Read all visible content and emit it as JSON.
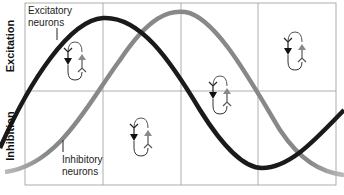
{
  "axes": {
    "top_label": "Excitation",
    "bottom_label": "Inhibition"
  },
  "labels": {
    "excitatory": [
      "Excitatory",
      "neurons"
    ],
    "inhibitory": [
      "Inhibitory",
      "neurons"
    ]
  },
  "colors": {
    "excitatory_curve": "#1a1a1a",
    "inhibitory_curve": "#8a8a8a",
    "grid": "#9a9a9a"
  },
  "curves": [
    {
      "name": "Excitatory neurons",
      "phase": "peak at column 1/2 boundary, trough at column 3/4 boundary"
    },
    {
      "name": "Inhibitory neurons",
      "phase": "lagging excitatory by a quarter period"
    }
  ],
  "circuit_icons": [
    {
      "position": "column-1-top"
    },
    {
      "position": "column-2-bottom"
    },
    {
      "position": "column-3-middle"
    },
    {
      "position": "column-4-top"
    }
  ]
}
